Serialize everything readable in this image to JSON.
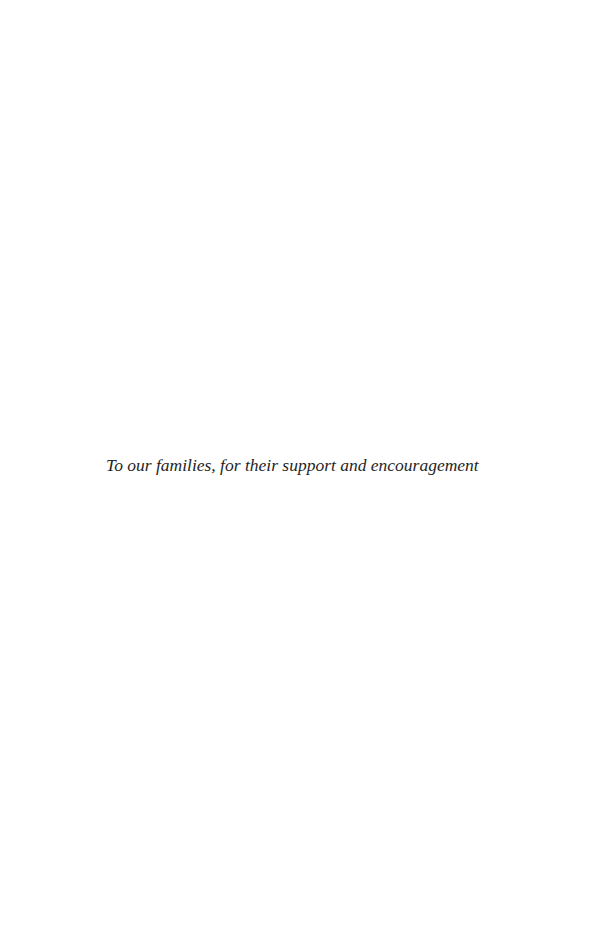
{
  "page": {
    "type": "dedication",
    "dedication_text": "To our families, for their support and encouragement"
  }
}
